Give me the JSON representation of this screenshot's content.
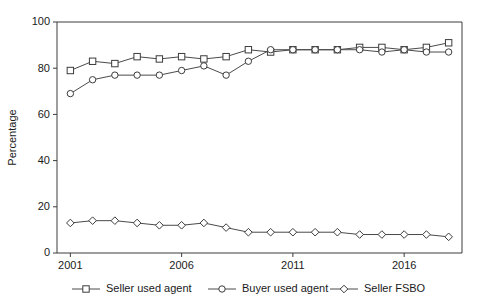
{
  "chart_data": {
    "type": "line",
    "title": "",
    "xlabel": "",
    "ylabel": "Percentage",
    "xlim": [
      2000.4,
      2018.6
    ],
    "ylim": [
      0,
      100
    ],
    "yticks": [
      0,
      20,
      40,
      60,
      80,
      100
    ],
    "xticks": [
      2001,
      2006,
      2011,
      2016
    ],
    "xtick_labels": [
      "2001",
      "2006",
      "2011",
      "2016"
    ],
    "grid": false,
    "legend_position": "bottom",
    "x": [
      2001,
      2002,
      2003,
      2004,
      2005,
      2006,
      2007,
      2008,
      2009,
      2010,
      2011,
      2012,
      2013,
      2014,
      2015,
      2016,
      2017,
      2018
    ],
    "series": [
      {
        "name": "Seller used agent",
        "marker": "square",
        "values": [
          79,
          83,
          82,
          85,
          84,
          85,
          84,
          85,
          88,
          87,
          88,
          88,
          88,
          89,
          89,
          88,
          89,
          91
        ]
      },
      {
        "name": "Buyer used agent",
        "marker": "circle",
        "values": [
          69,
          75,
          77,
          77,
          77,
          79,
          81,
          77,
          83,
          88,
          88,
          88,
          88,
          88,
          87,
          88,
          87,
          87
        ]
      },
      {
        "name": "Seller FSBO",
        "marker": "diamond",
        "values": [
          13,
          14,
          14,
          13,
          12,
          12,
          13,
          11,
          9,
          9,
          9,
          9,
          9,
          8,
          8,
          8,
          8,
          7
        ]
      }
    ]
  },
  "legend": {
    "items": [
      {
        "label": "Seller used agent",
        "marker": "square"
      },
      {
        "label": "Buyer used agent",
        "marker": "circle"
      },
      {
        "label": "Seller FSBO",
        "marker": "diamond"
      }
    ]
  },
  "colors": {
    "axis": "#3c3c3c",
    "line": "#4a4a4a",
    "marker_fill": "#ffffff",
    "background": "#ffffff",
    "text": "#1a1a1a"
  }
}
